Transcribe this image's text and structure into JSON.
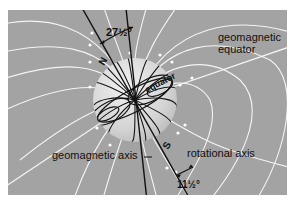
{
  "figure": {
    "panel_color": "#a3a3a3",
    "globe_color": "#d8d8d8",
    "labels": {
      "rotational_tilt": "27½°",
      "geomagnetic_equator_line1": "geomagnetic",
      "geomagnetic_equator_line2": "equator",
      "equator": "equator",
      "north": "N",
      "south": "S",
      "geomagnetic_axis": "geomagnetic axis",
      "rotational_axis": "rotational axis",
      "bottom_angle": "11½°"
    }
  }
}
